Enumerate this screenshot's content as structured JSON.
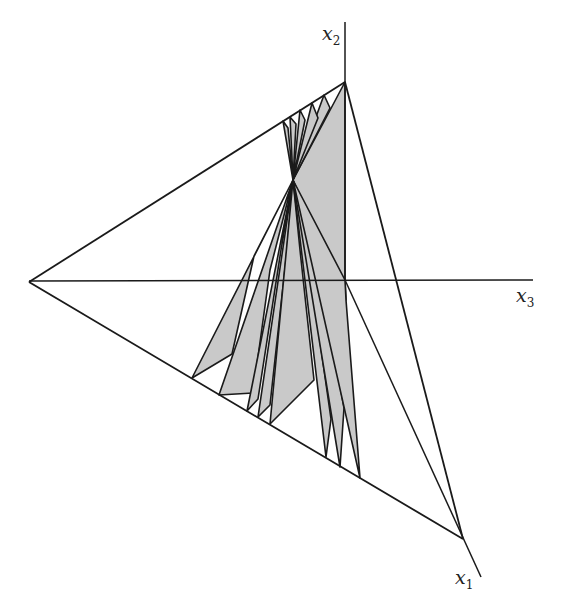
{
  "figure": {
    "colors": {
      "stroke": "#1a1a1a",
      "shade": "#c8c8c8",
      "background": "#ffffff"
    }
  },
  "labels": {
    "x1": {
      "var": "x",
      "sub": "1"
    },
    "x2": {
      "var": "x",
      "sub": "2"
    },
    "x3": {
      "var": "x",
      "sub": "3"
    }
  },
  "geometry": {
    "origin": [
      345,
      280
    ],
    "vertex_top": [
      345,
      82
    ],
    "vertex_left": [
      29,
      282
    ],
    "vertex_bottom": [
      463,
      539
    ],
    "convergence_point": [
      293,
      180
    ],
    "axis_x2_end": [
      345,
      22
    ],
    "axis_x3_end": [
      533,
      280
    ],
    "axis_x1_end": [
      481,
      577
    ]
  }
}
